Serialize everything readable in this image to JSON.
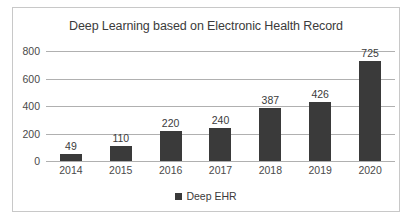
{
  "chart_data": {
    "type": "bar",
    "title": "Deep Learning based on Electronic Health Record",
    "xlabel": "",
    "ylabel": "",
    "categories": [
      "2014",
      "2015",
      "2016",
      "2017",
      "2018",
      "2019",
      "2020"
    ],
    "series": [
      {
        "name": "Deep EHR",
        "values": [
          49,
          110,
          220,
          240,
          387,
          426,
          725
        ],
        "color": "#3a3a3a"
      }
    ],
    "values": [
      49,
      110,
      220,
      240,
      387,
      426,
      725
    ],
    "data_labels": [
      "49",
      "110",
      "220",
      "240",
      "387",
      "426",
      "725"
    ],
    "ylim": [
      0,
      800
    ],
    "yticks": [
      0,
      200,
      400,
      600,
      800
    ],
    "ytick_labels": [
      "0",
      "200",
      "400",
      "600",
      "800"
    ],
    "grid": true,
    "grid_color": "#b0b0b0",
    "legend_position": "bottom",
    "legend": [
      {
        "label": "Deep EHR",
        "color": "#3a3a3a",
        "marker": "square"
      }
    ],
    "frame": {
      "border_color": "#c8c8c8",
      "background": "#ffffff"
    },
    "text_color": "#3b3b3b"
  }
}
